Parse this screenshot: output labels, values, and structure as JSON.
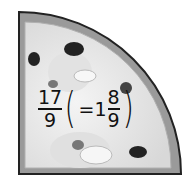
{
  "figure": {
    "fraction_label": {
      "improper": {
        "numerator": "17",
        "denominator": "9"
      },
      "open_paren": "(",
      "equals": "=",
      "mixed": {
        "whole": "1",
        "numerator": "8",
        "denominator": "9"
      },
      "close_paren": ")"
    }
  }
}
